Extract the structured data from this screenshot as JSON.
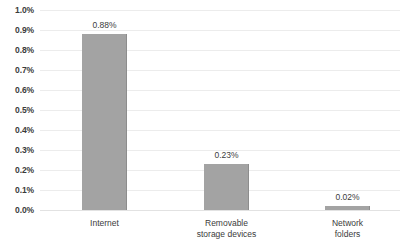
{
  "chart_data": {
    "type": "bar",
    "title": "",
    "subtitle": "",
    "xlabel": "",
    "ylabel": "",
    "categories": [
      "Internet",
      "Removable storage devices",
      "Network folders"
    ],
    "values": [
      0.88,
      0.23,
      0.02
    ],
    "value_labels": [
      "0.88%",
      "0.23%",
      "0.02%"
    ],
    "ylim": [
      0.0,
      1.0
    ],
    "ytick_values": [
      1.0,
      0.9,
      0.8,
      0.7,
      0.6,
      0.5,
      0.4,
      0.3,
      0.2,
      0.1,
      0.0
    ],
    "ytick_labels": [
      "1.0%",
      "0.9%",
      "0.8%",
      "0.7%",
      "0.6%",
      "0.5%",
      "0.4%",
      "0.3%",
      "0.2%",
      "0.1%",
      "0.0%"
    ],
    "grid": true,
    "legend": false,
    "legend_position": "none",
    "series": [
      {
        "name": "",
        "values": [
          0.88,
          0.23,
          0.02
        ]
      }
    ],
    "colors": {
      "bar": "#a3a3a3",
      "bar_edge": "#8d8d8d",
      "gridline": "#ececec",
      "baseline": "#e2e2e2",
      "text": "#3b3b3b",
      "background": "#ffffff"
    }
  },
  "axis": {
    "y_ticks": [
      {
        "label": "1.0%",
        "value": 1.0
      },
      {
        "label": "0.9%",
        "value": 0.9
      },
      {
        "label": "0.8%",
        "value": 0.8
      },
      {
        "label": "0.7%",
        "value": 0.7
      },
      {
        "label": "0.6%",
        "value": 0.6
      },
      {
        "label": "0.5%",
        "value": 0.5
      },
      {
        "label": "0.4%",
        "value": 0.4
      },
      {
        "label": "0.3%",
        "value": 0.3
      },
      {
        "label": "0.2%",
        "value": 0.2
      },
      {
        "label": "0.1%",
        "value": 0.1
      },
      {
        "label": "0.0%",
        "value": 0.0
      }
    ]
  },
  "bars": [
    {
      "category": "Internet",
      "category_lines": "Internet",
      "value": 0.88,
      "value_label": "0.88%",
      "center_x": 104.5,
      "width": 45
    },
    {
      "category": "Removable storage devices",
      "category_lines": "Removable\nstorage devices",
      "value": 0.23,
      "value_label": "0.23%",
      "center_x": 226.5,
      "width": 45
    },
    {
      "category": "Network folders",
      "category_lines": "Network\nfolders",
      "value": 0.02,
      "value_label": "0.02%",
      "center_x": 347.5,
      "width": 45
    }
  ]
}
